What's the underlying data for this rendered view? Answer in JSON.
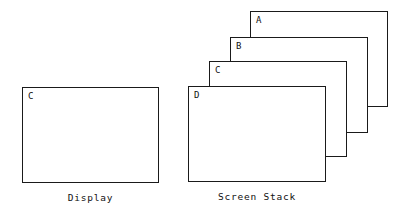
{
  "figure": {
    "background_color": "#ffffff",
    "line_color": "#1a1a1a",
    "text_color": "#111111"
  },
  "display_panel": {
    "caption": "Display",
    "screen": {
      "label": "C",
      "x": 22,
      "y": 87,
      "width": 137,
      "height": 96
    }
  },
  "screen_stack_panel": {
    "caption": "Screen Stack",
    "screens": [
      {
        "label": "A",
        "x": 250,
        "y": 11,
        "width": 138,
        "height": 96,
        "depth": 1
      },
      {
        "label": "B",
        "x": 230,
        "y": 37,
        "width": 138,
        "height": 96,
        "depth": 2
      },
      {
        "label": "C",
        "x": 209,
        "y": 61,
        "width": 138,
        "height": 96,
        "depth": 3
      },
      {
        "label": "D",
        "x": 188,
        "y": 86,
        "width": 138,
        "height": 96,
        "depth": 4
      }
    ]
  }
}
